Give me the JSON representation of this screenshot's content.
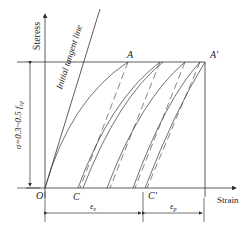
{
  "figure": {
    "y_axis_label": "Steress",
    "x_axis_label": "Strain",
    "tangent_label": "Initial tangent line",
    "origin_label": "O",
    "point_a": "A",
    "point_a_prime": "A'",
    "point_c": "C",
    "point_c_prime": "C'",
    "stress_range_label": "σ=0.3~0.5 f",
    "stress_range_sub": "cp",
    "eps_e_main": "ε",
    "eps_e_sub": "e",
    "eps_p_main": "ε",
    "eps_p_sub": "p",
    "colors": {
      "line": "#333333",
      "text": "#222222",
      "background": "#ffffff"
    }
  }
}
